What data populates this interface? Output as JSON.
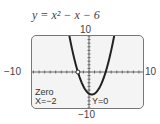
{
  "chart_data": {
    "type": "line",
    "title": "y = x² − x − 6",
    "equation": "y = x^2 - x - 6",
    "xlabel": "",
    "ylabel": "",
    "xlim": [
      -10,
      10
    ],
    "ylim": [
      -10,
      10
    ],
    "tick_labels": {
      "top": "10",
      "bottom": "−10",
      "left": "−10",
      "right": "10"
    },
    "grid": false,
    "series": [
      {
        "name": "y = x^2 - x - 6",
        "x": [
          -3,
          -2.5,
          -2,
          -1.5,
          -1,
          -0.5,
          0,
          0.5,
          1,
          1.5,
          2,
          2.5,
          3,
          3.5,
          4
        ],
        "y": [
          6,
          2.75,
          0,
          -2.25,
          -4,
          -5.25,
          -6,
          -6.25,
          -6,
          -5.25,
          -4,
          -2.25,
          0,
          2.75,
          6
        ]
      }
    ],
    "annotations": [
      {
        "type": "point",
        "x": -2,
        "y": 0,
        "label": "zero"
      }
    ],
    "readout": {
      "mode": "Zero",
      "x": "X=−2",
      "y": "Y=0"
    }
  }
}
